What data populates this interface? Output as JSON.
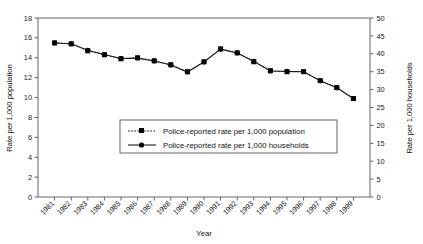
{
  "chart_data": {
    "type": "line",
    "title": "",
    "xlabel": "Year",
    "ylabel": "Rate per 1,000 population",
    "ylabel_right": "Rate per 1,000 households",
    "categories": [
      "1981",
      "1982",
      "1983",
      "1984",
      "1985",
      "1986",
      "1987",
      "1988",
      "1989",
      "1990",
      "1991",
      "1992",
      "1993",
      "1994",
      "1995",
      "1996",
      "1997",
      "1998",
      "1999"
    ],
    "ylim": [
      0,
      18
    ],
    "ylim_right": [
      0,
      50
    ],
    "yticks": [
      0,
      2,
      4,
      6,
      8,
      10,
      12,
      14,
      16,
      18
    ],
    "yticks_right": [
      0,
      5,
      10,
      15,
      20,
      25,
      30,
      35,
      40,
      45,
      50
    ],
    "grid": false,
    "legend_position": "inside-center-lower",
    "series": [
      {
        "name": "Police-reported rate per 1,000 population",
        "axis": "left",
        "style": "dotted",
        "marker": "square",
        "values": [
          14.8,
          14.7,
          14.3,
          14.1,
          13.9,
          13.8,
          13.9,
          13.5,
          13.1,
          13.6,
          15.1,
          14.8,
          14.1,
          13.3,
          13.3,
          13.3,
          12.5,
          11.6,
          10.3
        ]
      },
      {
        "name": "Police-reported rate per 1,000 households",
        "axis": "right",
        "style": "solid",
        "marker": "circle",
        "values": [
          43.0,
          42.8,
          41.0,
          39.8,
          38.7,
          38.8,
          38.0,
          36.9,
          34.9,
          37.7,
          41.3,
          40.2,
          37.9,
          35.2,
          35.1,
          35.0,
          32.5,
          30.5,
          27.5
        ]
      }
    ],
    "series_left_plot": [
      15.5,
      15.4,
      14.7,
      14.3,
      13.9,
      14.0,
      13.7,
      13.3,
      12.6,
      13.6,
      14.9,
      14.5,
      13.6,
      12.7,
      12.6,
      12.6,
      11.7,
      11.0,
      9.9
    ]
  },
  "axes": {
    "left_title": "Rate per 1,000 population",
    "right_title": "Rate per 1,000 households",
    "x_title": "Year"
  },
  "legend": {
    "items": [
      {
        "label": "Police-reported rate per 1,000 population",
        "style": "dotted",
        "marker": "square"
      },
      {
        "label": "Police-reported rate per 1,000 households",
        "style": "solid",
        "marker": "circle"
      }
    ]
  },
  "colors": {
    "line": "#1a1a1a",
    "marker": "#000000",
    "frame": "#555555",
    "background": "#ffffff"
  }
}
